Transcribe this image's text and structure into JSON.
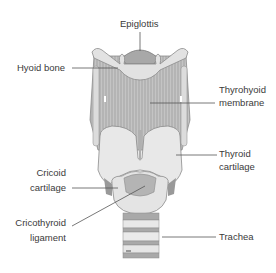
{
  "diagram": {
    "labels": {
      "epiglottis": "Epiglottis",
      "hyoid_bone": "Hyoid bone",
      "thyrohyoid_line1": "Thyrohyoid",
      "thyrohyoid_line2": "membrane",
      "thyroid_line1": "Thyroid",
      "thyroid_line2": "cartilage",
      "cricoid_line1": "Cricoid",
      "cricoid_line2": "cartilage",
      "cricothyroid_line1": "Cricothyroid",
      "cricothyroid_line2": "ligament",
      "trachea": "Trachea"
    },
    "colors": {
      "cartilage_fill": "#e6e6e6",
      "membrane_fill": "#bdbdbd",
      "dark_fill": "#a8a8a8",
      "outline": "#8c8c8c",
      "leader_line": "#555555",
      "text": "#3a3a3a"
    }
  }
}
